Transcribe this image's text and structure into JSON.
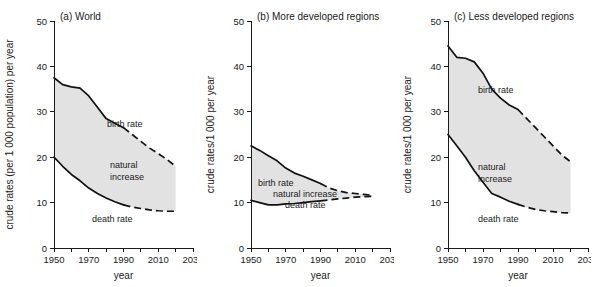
{
  "figure": {
    "background": "#ffffff",
    "fill_color": "#e2e2e2",
    "line_color": "#111111"
  },
  "labels": {
    "birth_rate": "birth rate",
    "death_rate": "death rate",
    "natural_increase_line1": "natural",
    "natural_increase_line2": "increase",
    "natural_increase_inline": "natural increase",
    "xaxis_title": "year"
  },
  "axis": {
    "x_ticks_labeled": [
      "1950",
      "1970",
      "1990",
      "2010",
      "2030"
    ],
    "x_ticks_minor": [
      "1960",
      "1980",
      "2000",
      "2020"
    ],
    "y_ticks": [
      "0",
      "10",
      "20",
      "30",
      "40",
      "50"
    ],
    "xlim": [
      1950,
      2030
    ],
    "ylim": [
      0,
      50
    ]
  },
  "chart_data": [
    {
      "id": "panel-a",
      "type": "area",
      "title": "(a) World",
      "xlabel": "year",
      "ylabel": "crude rates (per 1 000 population) per year",
      "xlim": [
        1950,
        2030
      ],
      "ylim": [
        0,
        50
      ],
      "grid": false,
      "legend": "inline-annotations",
      "x_observed": [
        1950,
        1955,
        1960,
        1965,
        1970,
        1975,
        1980,
        1985,
        1990
      ],
      "x_projected": [
        1990,
        1995,
        2000,
        2005,
        2010,
        2015,
        2020
      ],
      "series": [
        {
          "name": "birth rate",
          "observed": [
            37.5,
            36.0,
            35.5,
            35.2,
            33.5,
            31.0,
            28.5,
            27.5,
            26.5
          ],
          "projected": [
            26.5,
            25.0,
            23.5,
            22.0,
            20.8,
            19.5,
            18.0
          ]
        },
        {
          "name": "death rate",
          "observed": [
            20.0,
            18.0,
            16.2,
            14.8,
            13.2,
            12.0,
            11.0,
            10.2,
            9.5
          ],
          "projected": [
            9.5,
            9.0,
            8.7,
            8.4,
            8.2,
            8.1,
            8.1
          ]
        }
      ],
      "area_label": "natural increase"
    },
    {
      "id": "panel-b",
      "type": "area",
      "title": "(b) More developed regions",
      "xlabel": "year",
      "ylabel": "crude rates/1 000 per year",
      "xlim": [
        1950,
        2030
      ],
      "ylim": [
        0,
        50
      ],
      "grid": false,
      "legend": "inline-annotations",
      "x_observed": [
        1950,
        1955,
        1960,
        1965,
        1970,
        1975,
        1980,
        1985,
        1990
      ],
      "x_projected": [
        1990,
        1995,
        2000,
        2005,
        2010,
        2015,
        2020
      ],
      "series": [
        {
          "name": "birth rate",
          "observed": [
            22.5,
            21.5,
            20.3,
            19.2,
            17.6,
            16.5,
            15.8,
            15.0,
            14.2
          ],
          "projected": [
            14.2,
            13.2,
            12.6,
            12.2,
            12.0,
            11.8,
            11.6
          ]
        },
        {
          "name": "death rate",
          "observed": [
            10.5,
            10.0,
            9.5,
            9.5,
            9.7,
            9.8,
            10.0,
            10.2,
            10.4
          ],
          "projected": [
            10.4,
            10.6,
            10.8,
            11.0,
            11.2,
            11.3,
            11.4
          ]
        }
      ],
      "area_label": "natural increase"
    },
    {
      "id": "panel-c",
      "type": "area",
      "title": "(c) Less developed regions",
      "xlabel": "year",
      "ylabel": "crude rates/1 000 per year",
      "xlim": [
        1950,
        2030
      ],
      "ylim": [
        0,
        50
      ],
      "grid": false,
      "legend": "inline-annotations",
      "x_observed": [
        1950,
        1955,
        1960,
        1965,
        1970,
        1975,
        1980,
        1985,
        1990
      ],
      "x_projected": [
        1990,
        1995,
        2000,
        2005,
        2010,
        2015,
        2020
      ],
      "series": [
        {
          "name": "birth rate",
          "observed": [
            44.5,
            42.0,
            41.8,
            41.0,
            38.5,
            35.0,
            33.0,
            31.5,
            30.5
          ],
          "projected": [
            30.5,
            28.5,
            26.5,
            24.5,
            22.5,
            20.5,
            19.0
          ]
        },
        {
          "name": "death rate",
          "observed": [
            25.0,
            22.5,
            20.0,
            17.0,
            14.5,
            12.0,
            11.2,
            10.3,
            9.6
          ],
          "projected": [
            9.6,
            9.0,
            8.5,
            8.2,
            8.0,
            7.8,
            7.7
          ]
        }
      ],
      "area_label": "natural increase"
    }
  ]
}
